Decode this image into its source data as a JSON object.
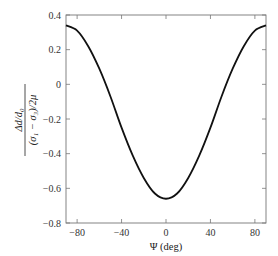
{
  "chart_data": {
    "type": "line",
    "title": "",
    "xlabel": "Ψ (deg)",
    "ylabel_numerator": "Δd/d₀",
    "ylabel_denominator": "(σ₁ − σ₃)/2μ",
    "xlim": [
      -90,
      90
    ],
    "ylim": [
      -0.8,
      0.4
    ],
    "xticks": [
      -80,
      -40,
      0,
      40,
      80
    ],
    "xtick_labels": [
      "−80",
      "−40",
      "0",
      "40",
      "80"
    ],
    "yticks": [
      0.4,
      0.2,
      0,
      -0.2,
      -0.4,
      -0.6,
      -0.8
    ],
    "ytick_labels": [
      "0.4",
      "0.2",
      "0",
      "−0.2",
      "−0.4",
      "−0.6",
      "−0.8"
    ],
    "grid": false,
    "legend": "none",
    "series": [
      {
        "name": "strain",
        "x": [
          -90,
          -80,
          -70,
          -60,
          -50,
          -40,
          -30,
          -20,
          -10,
          0,
          10,
          20,
          30,
          40,
          50,
          60,
          70,
          80,
          90
        ],
        "values": [
          0.34,
          0.31,
          0.22,
          0.09,
          -0.07,
          -0.25,
          -0.41,
          -0.54,
          -0.63,
          -0.66,
          -0.63,
          -0.54,
          -0.41,
          -0.25,
          -0.07,
          0.09,
          0.22,
          0.31,
          0.34
        ]
      }
    ]
  }
}
